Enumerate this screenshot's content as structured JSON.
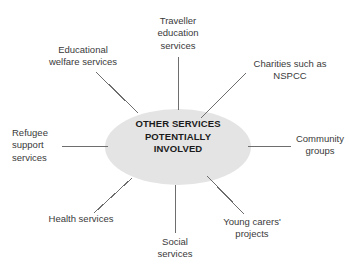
{
  "diagram": {
    "type": "radial-spoke",
    "hub": {
      "label": "OTHER SERVICES POTENTIALLY INVOLVED",
      "lines": [
        "OTHER SERVICES",
        "POTENTIALLY",
        "INVOLVED"
      ],
      "fill_color": "#e4e4e4",
      "shape": "ellipse"
    },
    "line_color": "#6e6e6e",
    "text_color": "#3a3a3a",
    "background_color": "#ffffff",
    "nodes": [
      {
        "id": "traveller-education-services",
        "label": "Traveller education services",
        "lines": [
          "Traveller",
          "education",
          "services"
        ],
        "position": "top"
      },
      {
        "id": "educational-welfare-services",
        "label": "Educational welfare services",
        "lines": [
          "Educational",
          "welfare services"
        ],
        "position": "top-left"
      },
      {
        "id": "charities-such-as-nspcc",
        "label": "Charities such as NSPCC",
        "lines": [
          "Charities such as",
          "NSPCC"
        ],
        "position": "top-right"
      },
      {
        "id": "refugee-support-services",
        "label": "Refugee support services",
        "lines": [
          "Refugee",
          "support",
          "services"
        ],
        "position": "left"
      },
      {
        "id": "community-groups",
        "label": "Community groups",
        "lines": [
          "Community",
          "groups"
        ],
        "position": "right"
      },
      {
        "id": "health-services",
        "label": "Health services",
        "lines": [
          "Health services"
        ],
        "position": "bottom-left"
      },
      {
        "id": "social-services",
        "label": "Social services",
        "lines": [
          "Social",
          "services"
        ],
        "position": "bottom"
      },
      {
        "id": "young-carers-projects",
        "label": "Young carers' projects",
        "lines": [
          "Young carers'",
          "projects"
        ],
        "position": "bottom-right"
      }
    ]
  }
}
